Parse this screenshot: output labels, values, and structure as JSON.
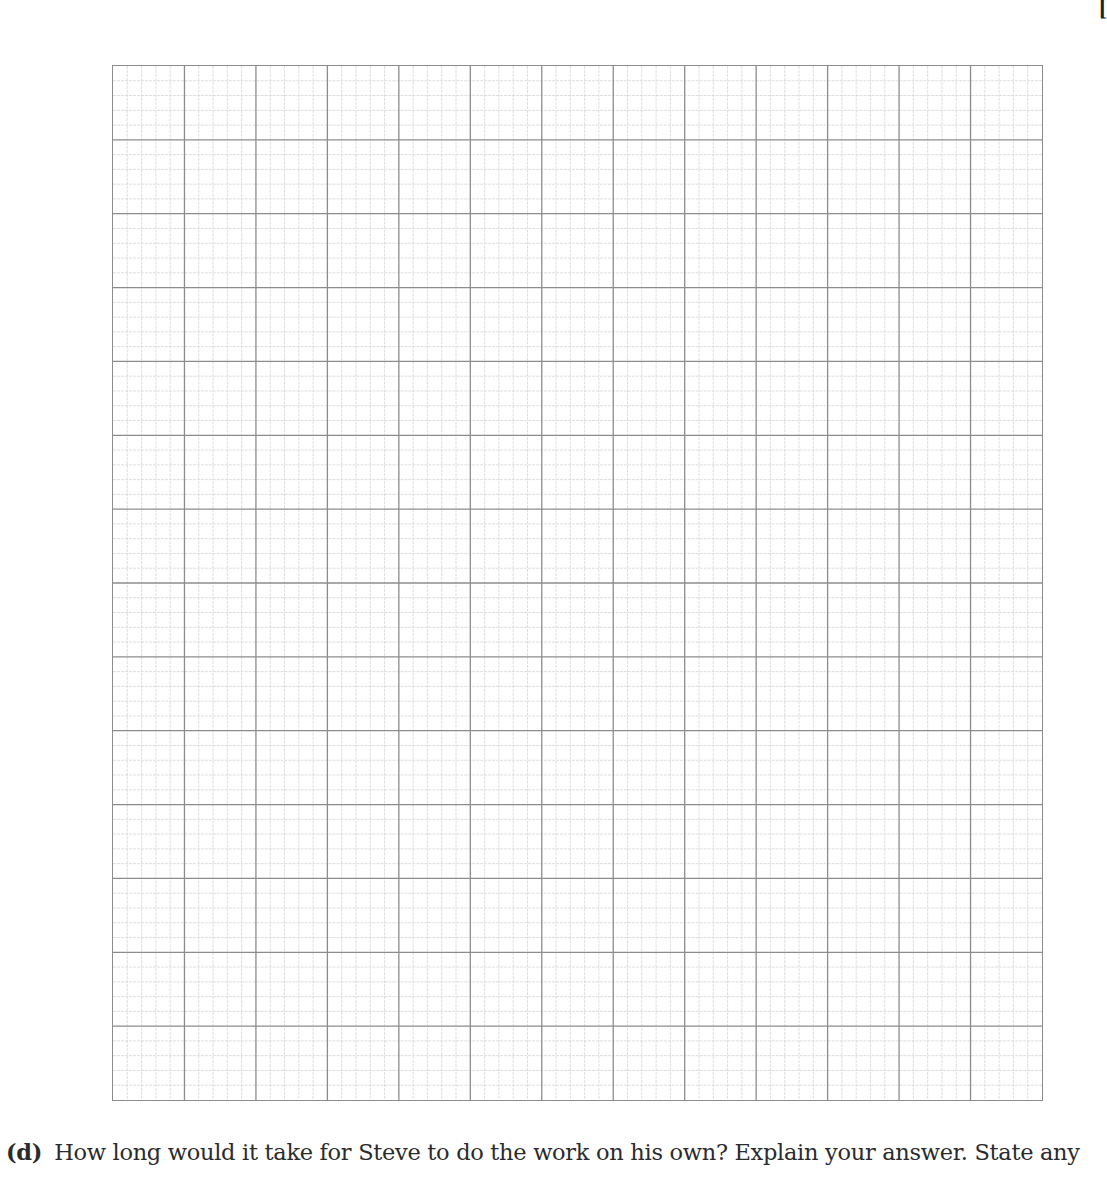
{
  "page": {
    "marks_fragment": "[",
    "graph_paper": {
      "major_columns": 13,
      "major_rows": 14,
      "minor_per_major": 5,
      "major_line_color": "#8c8c8c",
      "minor_line_color": "#d6d6d6"
    },
    "question": {
      "label": "(d)",
      "text": "How long would it take for Steve to do the work on his own? Explain your answer. State any"
    }
  }
}
